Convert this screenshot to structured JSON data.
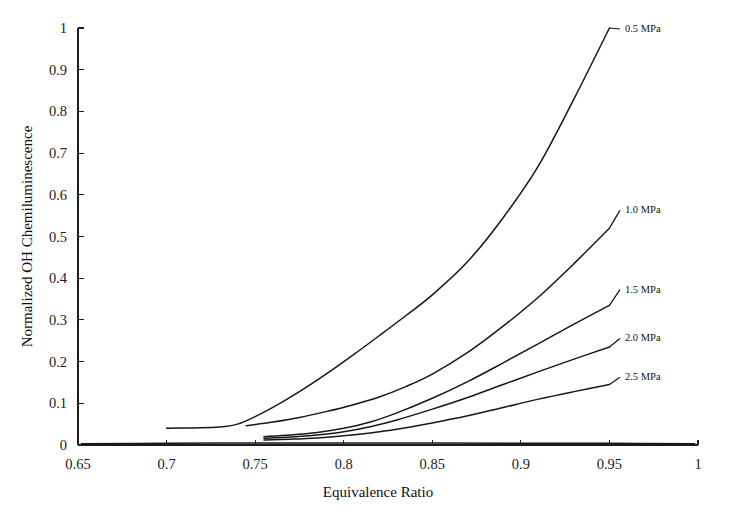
{
  "chart_data": {
    "type": "line",
    "title": "",
    "xlabel": "Equivalence Ratio",
    "ylabel": "Normalized OH Chemiluminescence",
    "xlim": [
      0.65,
      1.0
    ],
    "ylim": [
      0,
      1
    ],
    "xticks": [
      "0.65",
      "0.7",
      "0.75",
      "0.8",
      "0.85",
      "0.9",
      "0.95",
      "1"
    ],
    "xtick_values": [
      0.65,
      0.7,
      0.75,
      0.8,
      0.85,
      0.9,
      0.95,
      1.0
    ],
    "yticks": [
      "0",
      "0.1",
      "0.2",
      "0.3",
      "0.4",
      "0.5",
      "0.6",
      "0.7",
      "0.8",
      "0.9",
      "1"
    ],
    "ytick_values": [
      0,
      0.1,
      0.2,
      0.3,
      0.4,
      0.5,
      0.6,
      0.7,
      0.8,
      0.9,
      1.0
    ],
    "grid": false,
    "legend_position": "right-inline-labels",
    "series": [
      {
        "name": "0.5 MPa",
        "label": "0.5 MPa",
        "x": [
          0.7,
          0.715,
          0.73,
          0.74,
          0.75,
          0.76,
          0.775,
          0.79,
          0.805,
          0.82,
          0.835,
          0.85,
          0.87,
          0.89,
          0.91,
          0.93,
          0.95
        ],
        "values": [
          0.04,
          0.041,
          0.043,
          0.05,
          0.068,
          0.09,
          0.128,
          0.17,
          0.215,
          0.262,
          0.31,
          0.36,
          0.44,
          0.545,
          0.67,
          0.83,
          1.0
        ],
        "label_x": 0.952,
        "label_y": 1.0
      },
      {
        "name": "1.0 MPa",
        "label": "1.0 MPa",
        "x": [
          0.745,
          0.76,
          0.775,
          0.79,
          0.805,
          0.82,
          0.835,
          0.85,
          0.87,
          0.89,
          0.91,
          0.93,
          0.95
        ],
        "values": [
          0.046,
          0.055,
          0.066,
          0.08,
          0.096,
          0.115,
          0.14,
          0.17,
          0.222,
          0.285,
          0.355,
          0.435,
          0.52
        ],
        "label_x": 0.952,
        "label_y": 0.565
      },
      {
        "name": "1.5 MPa",
        "label": "1.5 MPa",
        "x": [
          0.755,
          0.77,
          0.785,
          0.8,
          0.815,
          0.83,
          0.85,
          0.87,
          0.89,
          0.91,
          0.93,
          0.95
        ],
        "values": [
          0.02,
          0.024,
          0.03,
          0.04,
          0.055,
          0.077,
          0.112,
          0.152,
          0.197,
          0.243,
          0.29,
          0.335
        ],
        "label_x": 0.952,
        "label_y": 0.375
      },
      {
        "name": "2.0 MPa",
        "label": "2.0 MPa",
        "x": [
          0.755,
          0.77,
          0.785,
          0.8,
          0.815,
          0.83,
          0.85,
          0.87,
          0.89,
          0.91,
          0.93,
          0.95
        ],
        "values": [
          0.016,
          0.019,
          0.024,
          0.032,
          0.044,
          0.06,
          0.086,
          0.114,
          0.145,
          0.176,
          0.206,
          0.235
        ],
        "label_x": 0.952,
        "label_y": 0.258
      },
      {
        "name": "2.5 MPa",
        "label": "2.5 MPa",
        "x": [
          0.755,
          0.77,
          0.785,
          0.8,
          0.815,
          0.83,
          0.85,
          0.87,
          0.89,
          0.91,
          0.93,
          0.95
        ],
        "values": [
          0.012,
          0.014,
          0.017,
          0.022,
          0.029,
          0.038,
          0.053,
          0.07,
          0.09,
          0.11,
          0.128,
          0.145
        ],
        "label_x": 0.952,
        "label_y": 0.165
      },
      {
        "name": "baseline",
        "label": "",
        "x": [
          0.652,
          0.7,
          0.75,
          0.8,
          0.85,
          0.9,
          0.95,
          0.998
        ],
        "values": [
          0.003,
          0.004,
          0.005,
          0.005,
          0.005,
          0.004,
          0.004,
          0.003
        ],
        "label_x": null,
        "label_y": null
      }
    ],
    "colors": {
      "curve": "#171717",
      "axis": "#1d1d1d",
      "text": "#141414",
      "background": "#ffffff"
    }
  }
}
